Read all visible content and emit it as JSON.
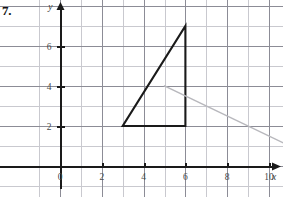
{
  "problem": {
    "number_label": "7."
  },
  "figure": {
    "axes": {
      "x_axis_name": "x",
      "y_axis_name": "y",
      "x_tick_labels": [
        "0",
        "2",
        "4",
        "6",
        "8",
        "10"
      ],
      "x_tick_values": [
        0,
        2,
        4,
        6,
        8,
        10
      ],
      "y_tick_labels": [
        "2",
        "4",
        "6"
      ],
      "y_tick_values": [
        2,
        4,
        6
      ],
      "x_range": [
        -1,
        12
      ],
      "y_range": [
        -1,
        9
      ],
      "grid": true,
      "grid_step": 1,
      "arrow_x": true,
      "arrow_y": true
    },
    "colors": {
      "grid_minor": "#c9c9cf",
      "grid_major": "#8c8c96",
      "axis": "#1a1a1a",
      "shape_dark": "#1a1a1a",
      "shape_light": "#b8b8bd",
      "tick_label": "#4a4a4a",
      "background": "#ffffff"
    },
    "shapes": [
      {
        "name": "preimage-triangle",
        "style": "dark",
        "points": [
          [
            3,
            2
          ],
          [
            6,
            2
          ],
          [
            6,
            7
          ]
        ]
      },
      {
        "name": "image-triangle",
        "style": "light",
        "points": [
          [
            5,
            4
          ],
          [
            11,
            1
          ],
          [
            11,
            1
          ]
        ]
      }
    ]
  },
  "chart_data": {
    "type": "scatter",
    "title": "",
    "xlabel": "x",
    "ylabel": "y",
    "xlim": [
      -1,
      12
    ],
    "ylim": [
      -1,
      9
    ],
    "grid": true,
    "x_ticks": [
      0,
      2,
      4,
      6,
      8,
      10
    ],
    "y_ticks": [
      2,
      4,
      6
    ],
    "series": [
      {
        "name": "dark right triangle",
        "type": "polygon",
        "color": "#1a1a1a",
        "closed": true,
        "points": [
          [
            3,
            2
          ],
          [
            6,
            2
          ],
          [
            6,
            7
          ]
        ]
      },
      {
        "name": "light gray segment",
        "type": "line",
        "color": "#b8b8bd",
        "closed": false,
        "points": [
          [
            5,
            4
          ],
          [
            11,
            1
          ]
        ]
      }
    ]
  }
}
